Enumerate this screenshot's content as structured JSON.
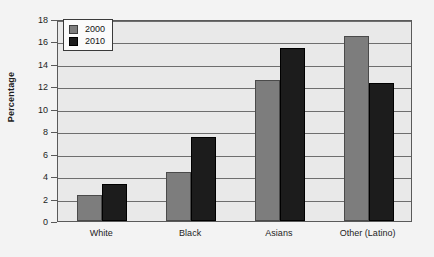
{
  "chart_data": {
    "type": "bar",
    "title": "",
    "subtitle": "",
    "xlabel": "",
    "ylabel": "Percentage",
    "categories": [
      "White",
      "Black",
      "Asians",
      "Other (Latino)"
    ],
    "series": [
      {
        "name": "2000",
        "color": "#7d7d7d",
        "values": [
          2.35,
          4.35,
          12.55,
          16.5
        ]
      },
      {
        "name": "2010",
        "color": "#1c1c1c",
        "values": [
          3.3,
          7.5,
          15.4,
          12.3
        ]
      }
    ],
    "ylim": [
      0,
      18
    ],
    "yticks": [
      0,
      2,
      4,
      6,
      8,
      10,
      12,
      14,
      16,
      18
    ],
    "ytick_labels": [
      "0",
      "2",
      "4",
      "6",
      "8",
      "10",
      "12",
      "14",
      "16",
      "18"
    ],
    "grid": true,
    "legend_position": "top-left",
    "legend_entries": [
      "2000",
      "2010"
    ],
    "annotations": []
  },
  "colors": {
    "page_background": "#f3f3f3",
    "plot_background": "#e9e9e9",
    "axis": "#5a5a5a",
    "gridline": "#6e6e6e",
    "text": "#1d1d1d",
    "legend_background": "#fbfbfb",
    "legend_border": "#3a3a3a"
  }
}
